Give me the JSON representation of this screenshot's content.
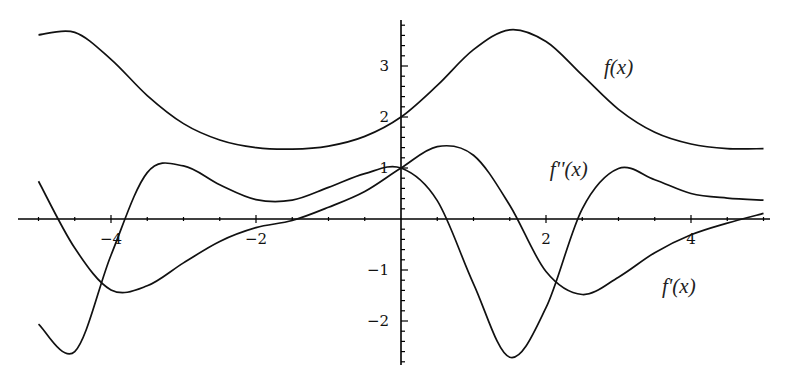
{
  "chart_data": {
    "type": "line",
    "title": "",
    "xlabel": "",
    "ylabel": "",
    "xlim": [
      -5,
      5
    ],
    "ylim": [
      -2.9,
      3.9
    ],
    "grid": false,
    "legend": "inline curve labels",
    "x_ticks": [
      {
        "value": -4,
        "label": "-4"
      },
      {
        "value": -2,
        "label": "-2"
      },
      {
        "value": 2,
        "label": "2"
      },
      {
        "value": 4,
        "label": "4"
      }
    ],
    "y_ticks": [
      {
        "value": 3,
        "label": "3"
      },
      {
        "value": 2,
        "label": "2"
      },
      {
        "value": 1,
        "label": "1"
      },
      {
        "value": -1,
        "label": "-1"
      },
      {
        "value": -2,
        "label": "-2"
      }
    ],
    "x": [
      -5,
      -4.5,
      -4,
      -3.5,
      -3,
      -2.5,
      -2,
      -1.5,
      -1,
      -0.5,
      0,
      0.5,
      1,
      1.5,
      2,
      2.5,
      3,
      3.5,
      4,
      4.5,
      5
    ],
    "series": [
      {
        "name": "f(x)",
        "label": "f(x)",
        "values": [
          3.61,
          3.66,
          3.13,
          2.42,
          1.87,
          1.55,
          1.4,
          1.37,
          1.43,
          1.62,
          2.0,
          2.62,
          3.32,
          3.71,
          3.48,
          2.82,
          2.15,
          1.7,
          1.47,
          1.38,
          1.38
        ]
      },
      {
        "name": "f'(x)",
        "label": "f'(x)",
        "values": [
          0.74,
          -0.57,
          -1.39,
          -1.31,
          -0.86,
          -0.44,
          -0.17,
          -0.03,
          0.23,
          0.54,
          1.0,
          1.42,
          1.25,
          0.27,
          -1.03,
          -1.48,
          -1.14,
          -0.66,
          -0.31,
          -0.08,
          0.11
        ]
      },
      {
        "name": "f''(x)",
        "label": "f''(x)",
        "values": [
          -2.06,
          -2.6,
          -0.71,
          0.91,
          1.04,
          0.67,
          0.38,
          0.37,
          0.62,
          0.89,
          1.0,
          0.36,
          -1.27,
          -2.71,
          -1.74,
          0.2,
          0.99,
          0.77,
          0.5,
          0.41,
          0.37
        ]
      }
    ],
    "annotations": [
      {
        "text": "f(x)",
        "x": 2.8,
        "y": 2.85
      },
      {
        "text": "f''(x)",
        "x": 2.05,
        "y": 0.85
      },
      {
        "text": "f'(x)",
        "x": 3.6,
        "y": -1.45
      }
    ]
  },
  "plot_layout": {
    "origin_px": [
      401,
      219
    ],
    "x_unit_px": 72.5,
    "y_unit_px": 51,
    "x_axis_px_range": [
      18,
      770
    ],
    "y_axis_px_range": [
      20,
      365
    ]
  }
}
